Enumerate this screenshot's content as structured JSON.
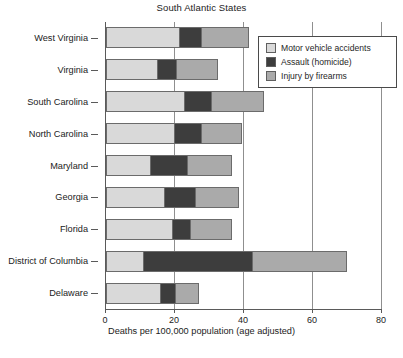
{
  "chart_data": {
    "type": "bar",
    "orientation": "horizontal",
    "stacked": true,
    "title": "South Atlantic States",
    "xlabel": "Deaths per 100,000 population (age adjusted)",
    "ylabel": "",
    "xlim": [
      0,
      80
    ],
    "xticks": [
      0,
      20,
      40,
      60,
      80
    ],
    "xtick_labels": [
      "0",
      "20",
      "40",
      "60",
      "80"
    ],
    "grid": true,
    "grid_axis": "x",
    "legend_position": "upper right",
    "categories": [
      "West Virginia",
      "Virginia",
      "South Carolina",
      "North Carolina",
      "Maryland",
      "Georgia",
      "Florida",
      "District of Columbia",
      "Delaware"
    ],
    "series": [
      {
        "name": "Motor vehicle accidents",
        "color": "#d9d9d9",
        "values": [
          21.5,
          15.0,
          23.0,
          20.0,
          13.0,
          17.0,
          19.5,
          11.0,
          16.0
        ]
      },
      {
        "name": "Assault (homicide)",
        "color": "#3d3d3d",
        "values": [
          6.5,
          6.0,
          8.0,
          8.0,
          11.0,
          9.5,
          5.5,
          32.0,
          4.5
        ]
      },
      {
        "name": "Injury by firearms",
        "color": "#aaaaaa",
        "values": [
          14.0,
          12.0,
          15.4,
          12.0,
          13.0,
          12.5,
          12.0,
          27.5,
          7.0
        ]
      }
    ],
    "totals": [
      42.0,
      33.0,
      46.4,
      40.0,
      37.0,
      39.0,
      37.0,
      70.5,
      27.5
    ]
  },
  "legend": {
    "entries": [
      {
        "label": "Motor vehicle accidents",
        "swatch": "legend-swatch-motor-vehicle"
      },
      {
        "label": "Assault (homicide)",
        "swatch": "legend-swatch-assault"
      },
      {
        "label": "Injury by firearms",
        "swatch": "legend-swatch-firearms"
      }
    ]
  },
  "caption": {
    "text": ""
  },
  "colors": {
    "motor_vehicle": "#d9d9d9",
    "assault": "#3d3d3d",
    "firearms": "#aaaaaa",
    "axis": "#5a5a5a",
    "grid": "#8f8f8f",
    "bar_outline": "#6b6b6b",
    "background": "#ffffff"
  }
}
